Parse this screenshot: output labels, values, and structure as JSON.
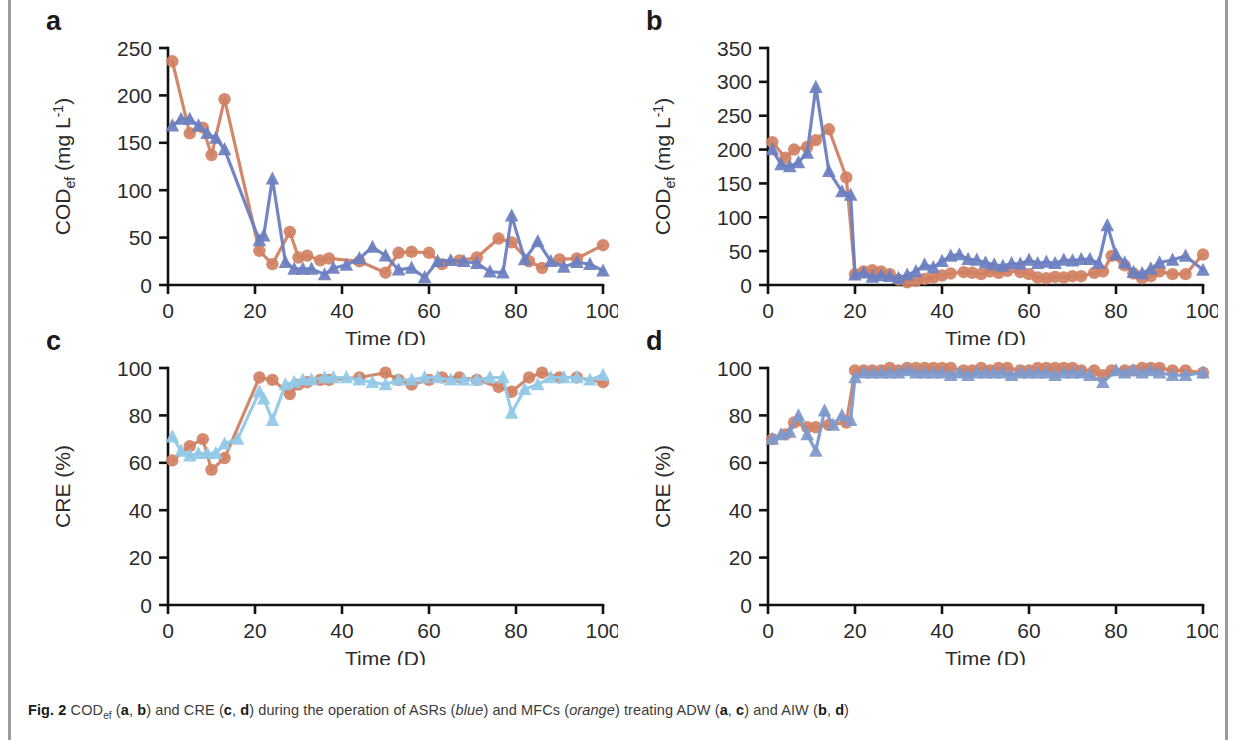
{
  "figure": {
    "caption_label": "Fig. 2",
    "caption_parts": {
      "t1": "COD",
      "sub1": "ef",
      "t2": " (",
      "b1": "a",
      "t3": ", ",
      "b2": "b",
      "t4": ") and CRE (",
      "b3": "c",
      "t5": ", ",
      "b4": "d",
      "t6": ") during the operation of ASRs (",
      "i1": "blue",
      "t7": ") and MFCs (",
      "i2": "orange",
      "t8": ") treating ADW (",
      "b5": "a",
      "t9": ", ",
      "b6": "c",
      "t10": ") and AIW (",
      "b7": "b",
      "t11": ", ",
      "b8": "d",
      "t12": ")"
    },
    "caption_full": "Fig. 2 CODef (a, b) and CRE (c, d) during the operation of ASRs (blue) and MFCs (orange) treating ADW (a, c) and AIW (b, d)"
  },
  "colors": {
    "orange": "#d18163",
    "blue_dark": "#6b7fc0",
    "blue_light": "#91c9e8",
    "blue_mid": "#7e99cb",
    "axis": "#111111",
    "text": "#2b2b2b"
  },
  "chart_data": [
    {
      "id": "a",
      "panel_letter": "a",
      "type": "line",
      "title": "",
      "xlabel": "Time (D)",
      "ylabel": "CODef (mg L-1)",
      "ylabel_parts": {
        "main": "COD",
        "sub": "ef",
        "unit": " (mg L",
        "sup": "-1",
        "close": ")"
      },
      "xlim": [
        0,
        100
      ],
      "ylim": [
        0,
        250
      ],
      "xticks": [
        0,
        20,
        40,
        60,
        80,
        100
      ],
      "yticks": [
        0,
        50,
        100,
        150,
        200,
        250
      ],
      "grid": false,
      "legend": "none",
      "series": [
        {
          "name": "MFCs (orange)",
          "color": "#d18163",
          "marker": "circle",
          "x": [
            1,
            5,
            8,
            10,
            13,
            21,
            24,
            28,
            30,
            32,
            35,
            37,
            44,
            50,
            53,
            56,
            60,
            63,
            67,
            71,
            76,
            79,
            83,
            86,
            90,
            94,
            100
          ],
          "y": [
            236,
            160,
            166,
            137,
            196,
            36,
            22,
            56,
            29,
            31,
            26,
            28,
            25,
            13,
            34,
            35,
            34,
            22,
            26,
            29,
            49,
            45,
            25,
            18,
            27,
            28,
            42
          ]
        },
        {
          "name": "ASRs (blue)",
          "color": "#6b7fc0",
          "marker": "triangle",
          "x": [
            1,
            3,
            5,
            7,
            9,
            11,
            13,
            21,
            22,
            24,
            27,
            29,
            31,
            33,
            36,
            38,
            41,
            44,
            47,
            50,
            53,
            56,
            59,
            62,
            65,
            68,
            71,
            74,
            77,
            79,
            82,
            85,
            88,
            91,
            94,
            97,
            100
          ],
          "y": [
            168,
            175,
            175,
            168,
            160,
            155,
            143,
            47,
            52,
            112,
            24,
            17,
            17,
            17,
            11,
            18,
            21,
            28,
            40,
            31,
            16,
            18,
            8,
            25,
            26,
            25,
            23,
            14,
            13,
            73,
            27,
            46,
            25,
            19,
            24,
            22,
            15
          ]
        }
      ]
    },
    {
      "id": "b",
      "panel_letter": "b",
      "type": "line",
      "title": "",
      "xlabel": "Time (D)",
      "ylabel": "CODef (mg L-1)",
      "ylabel_parts": {
        "main": "COD",
        "sub": "ef",
        "unit": " (mg L",
        "sup": "-1",
        "close": ")"
      },
      "xlim": [
        0,
        100
      ],
      "ylim": [
        0,
        350
      ],
      "xticks": [
        0,
        20,
        40,
        60,
        80,
        100
      ],
      "yticks": [
        0,
        50,
        100,
        150,
        200,
        250,
        300,
        350
      ],
      "grid": false,
      "legend": "none",
      "series": [
        {
          "name": "MFCs (orange)",
          "color": "#d18163",
          "marker": "circle",
          "x": [
            1,
            4,
            6,
            9,
            11,
            14,
            18,
            20,
            22,
            24,
            26,
            28,
            30,
            32,
            34,
            36,
            38,
            40,
            42,
            45,
            47,
            49,
            51,
            53,
            55,
            58,
            60,
            62,
            64,
            66,
            68,
            70,
            72,
            75,
            77,
            79,
            82,
            84,
            86,
            88,
            90,
            93,
            96,
            100
          ],
          "y": [
            211,
            188,
            200,
            204,
            214,
            230,
            159,
            16,
            20,
            22,
            20,
            16,
            8,
            4,
            6,
            9,
            11,
            14,
            17,
            19,
            18,
            16,
            20,
            18,
            21,
            19,
            16,
            11,
            10,
            12,
            11,
            13,
            13,
            18,
            20,
            43,
            29,
            17,
            10,
            13,
            20,
            16,
            16,
            45
          ]
        },
        {
          "name": "ASRs (blue)",
          "color": "#6b7fc0",
          "marker": "triangle",
          "x": [
            1,
            3,
            5,
            7,
            9,
            11,
            14,
            17,
            19,
            20,
            22,
            24,
            26,
            28,
            30,
            32,
            34,
            36,
            38,
            40,
            42,
            44,
            46,
            48,
            50,
            52,
            54,
            56,
            58,
            60,
            62,
            64,
            66,
            68,
            70,
            72,
            74,
            76,
            78,
            80,
            82,
            84,
            86,
            88,
            90,
            93,
            96,
            100
          ],
          "y": [
            200,
            178,
            175,
            181,
            195,
            292,
            168,
            138,
            133,
            15,
            18,
            12,
            14,
            13,
            10,
            15,
            20,
            30,
            26,
            35,
            43,
            45,
            38,
            37,
            33,
            30,
            28,
            32,
            31,
            37,
            32,
            34,
            32,
            37,
            36,
            38,
            38,
            32,
            88,
            45,
            33,
            19,
            17,
            24,
            33,
            37,
            43,
            22
          ]
        }
      ]
    },
    {
      "id": "c",
      "panel_letter": "c",
      "type": "line",
      "title": "",
      "xlabel": "Time (D)",
      "ylabel": "CRE (%)",
      "xlim": [
        0,
        100
      ],
      "ylim": [
        0,
        100
      ],
      "xticks": [
        0,
        20,
        40,
        60,
        80,
        100
      ],
      "yticks": [
        0,
        20,
        40,
        60,
        80,
        100
      ],
      "grid": false,
      "legend": "none",
      "series": [
        {
          "name": "MFCs (orange)",
          "color": "#d18163",
          "marker": "circle",
          "x": [
            1,
            5,
            8,
            10,
            13,
            21,
            24,
            28,
            30,
            32,
            35,
            37,
            44,
            50,
            53,
            56,
            60,
            63,
            67,
            71,
            76,
            79,
            83,
            86,
            90,
            94,
            100
          ],
          "y": [
            61,
            67,
            70,
            57,
            62,
            96,
            95,
            89,
            93,
            94,
            95,
            95,
            96,
            98,
            95,
            93,
            95,
            96,
            96,
            95,
            92,
            90,
            96,
            98,
            96,
            96,
            94
          ]
        },
        {
          "name": "ASRs (blue)",
          "color": "#91c9e8",
          "marker": "triangle",
          "x": [
            1,
            3,
            5,
            7,
            9,
            11,
            13,
            16,
            21,
            22,
            24,
            27,
            29,
            31,
            33,
            36,
            38,
            41,
            44,
            47,
            50,
            53,
            56,
            59,
            62,
            65,
            68,
            71,
            74,
            77,
            79,
            82,
            85,
            88,
            91,
            94,
            97,
            100
          ],
          "y": [
            71,
            65,
            63,
            64,
            64,
            64,
            68,
            70,
            90,
            87,
            78,
            93,
            94,
            95,
            95,
            96,
            96,
            96,
            95,
            94,
            93,
            95,
            95,
            96,
            96,
            95,
            95,
            95,
            96,
            96,
            81,
            91,
            93,
            96,
            96,
            96,
            95,
            97
          ]
        }
      ]
    },
    {
      "id": "d",
      "panel_letter": "d",
      "type": "line",
      "title": "",
      "xlabel": "Time (D)",
      "ylabel": "CRE (%)",
      "xlim": [
        0,
        100
      ],
      "ylim": [
        0,
        100
      ],
      "xticks": [
        0,
        20,
        40,
        60,
        80,
        100
      ],
      "yticks": [
        0,
        20,
        40,
        60,
        80,
        100
      ],
      "grid": false,
      "legend": "none",
      "series": [
        {
          "name": "MFCs (orange)",
          "color": "#d18163",
          "marker": "circle",
          "x": [
            1,
            4,
            6,
            9,
            11,
            14,
            18,
            20,
            22,
            24,
            26,
            28,
            30,
            32,
            34,
            36,
            38,
            40,
            42,
            45,
            47,
            49,
            51,
            53,
            55,
            58,
            60,
            62,
            64,
            66,
            68,
            70,
            72,
            75,
            77,
            79,
            82,
            84,
            86,
            88,
            90,
            93,
            96,
            100
          ],
          "y": [
            70,
            72,
            77,
            75,
            75,
            76,
            77,
            99,
            99,
            99,
            99,
            100,
            99,
            100,
            100,
            100,
            100,
            100,
            100,
            99,
            99,
            100,
            99,
            100,
            100,
            99,
            99,
            100,
            100,
            100,
            100,
            100,
            99,
            99,
            97,
            99,
            99,
            99,
            100,
            100,
            100,
            99,
            99,
            98
          ]
        },
        {
          "name": "ASRs (blue)",
          "color": "#7e99cb",
          "marker": "triangle",
          "x": [
            1,
            3,
            5,
            7,
            9,
            11,
            13,
            15,
            17,
            19,
            20,
            22,
            24,
            26,
            28,
            30,
            32,
            34,
            36,
            38,
            40,
            42,
            44,
            46,
            48,
            50,
            52,
            54,
            56,
            58,
            60,
            62,
            64,
            66,
            68,
            70,
            72,
            74,
            77,
            80,
            82,
            84,
            86,
            88,
            90,
            93,
            96,
            100
          ],
          "y": [
            70,
            72,
            73,
            80,
            72,
            65,
            82,
            76,
            80,
            78,
            96,
            98,
            98,
            98,
            98,
            98,
            99,
            98,
            98,
            98,
            98,
            97,
            98,
            97,
            98,
            98,
            98,
            98,
            97,
            98,
            98,
            98,
            98,
            97,
            98,
            98,
            98,
            97,
            94,
            99,
            98,
            99,
            98,
            99,
            98,
            97,
            97,
            98
          ]
        }
      ]
    }
  ]
}
